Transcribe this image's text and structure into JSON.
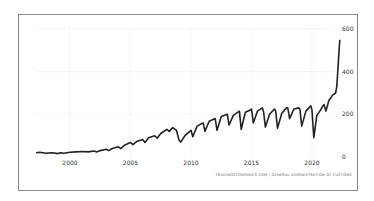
{
  "chart_data": {
    "type": "line",
    "title": "",
    "xlabel": "",
    "ylabel": "",
    "x_ticks": [
      "2000",
      "2005",
      "2010",
      "2015",
      "2020"
    ],
    "y_ticks": [
      "0",
      "200",
      "400",
      "600"
    ],
    "ylim": [
      0,
      600
    ],
    "xlim": [
      1997.2,
      2022.5
    ],
    "grid": true,
    "legend": "none",
    "y_axis_position": "right",
    "series": [
      {
        "name": "value",
        "color": "#222222",
        "x": [
          1997.2,
          1997.5,
          1998.0,
          1998.5,
          1999.0,
          1999.2,
          1999.5,
          2000.0,
          2000.5,
          2001.0,
          2001.5,
          2002.0,
          2002.2,
          2002.5,
          2003.0,
          2003.2,
          2003.5,
          2004.0,
          2004.2,
          2004.5,
          2005.0,
          2005.2,
          2005.5,
          2006.0,
          2006.2,
          2006.5,
          2007.0,
          2007.2,
          2007.5,
          2008.0,
          2008.2,
          2008.5,
          2008.8,
          2009.0,
          2009.15,
          2009.5,
          2010.0,
          2010.15,
          2010.5,
          2011.0,
          2011.15,
          2011.5,
          2012.0,
          2012.15,
          2012.5,
          2013.0,
          2013.15,
          2013.5,
          2014.0,
          2014.15,
          2014.5,
          2014.9,
          2015.0,
          2015.15,
          2015.5,
          2015.9,
          2016.0,
          2016.15,
          2016.5,
          2016.9,
          2017.0,
          2017.15,
          2017.5,
          2017.9,
          2018.0,
          2018.15,
          2018.5,
          2018.9,
          2019.0,
          2019.15,
          2019.5,
          2019.9,
          2020.0,
          2020.15,
          2020.4,
          2020.7,
          2020.9,
          2021.0,
          2021.15,
          2021.4,
          2021.7,
          2021.95,
          2022.05,
          2022.15,
          2022.3
        ],
        "values": [
          20,
          22,
          18,
          20,
          16,
          20,
          18,
          22,
          24,
          26,
          24,
          28,
          24,
          30,
          36,
          30,
          40,
          48,
          40,
          55,
          68,
          58,
          72,
          82,
          68,
          90,
          100,
          88,
          110,
          130,
          120,
          138,
          125,
          80,
          70,
          100,
          125,
          95,
          145,
          160,
          120,
          168,
          180,
          125,
          190,
          200,
          150,
          195,
          215,
          130,
          210,
          220,
          225,
          160,
          215,
          230,
          210,
          140,
          200,
          225,
          215,
          135,
          205,
          230,
          230,
          180,
          225,
          230,
          225,
          145,
          215,
          240,
          220,
          90,
          195,
          220,
          240,
          245,
          215,
          265,
          290,
          300,
          330,
          420,
          550
        ]
      }
    ]
  },
  "attribution": "TRADINGECONOMICS.COM | GENERAL ADMINISTRATION OF CUSTOMS"
}
